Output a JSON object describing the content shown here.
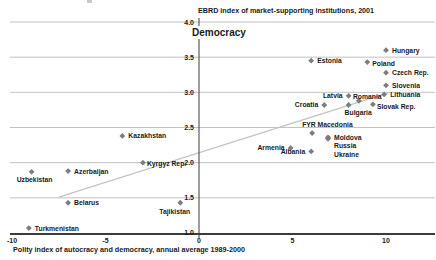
{
  "chart_data": {
    "type": "scatter",
    "title": "EBRD index of market-supporting institutions, 2001",
    "axis_heading": "Democracy",
    "xlabel": "Polity index of autocracy and democracy, annual average 1989-2000",
    "xlim": [
      -10.7,
      12.7
    ],
    "ylim": [
      1.0,
      4.0
    ],
    "x_ticks": [
      -10,
      -5,
      0,
      5,
      10
    ],
    "y_ticks": [
      4.0,
      3.5,
      3.0,
      2.5,
      2.0,
      1.5,
      1.0
    ],
    "grid": "horizontal-only",
    "legend": "none",
    "trend_line": {
      "x1": -7.5,
      "y1": 1.51,
      "x2": 10.2,
      "y2": 3.0
    },
    "colors": {
      "marker": "#7d7d7d",
      "gridline": "#b3b3b3",
      "axis": "#3c3c3c",
      "trend": "#c4c4c4",
      "text": "#1a1a1a",
      "background": "#ffffff"
    },
    "points": [
      {
        "name": "Hungary",
        "x": 10.0,
        "y": 3.6,
        "lx": 6,
        "ly": 2.5,
        "anchor": "start"
      },
      {
        "name": "Estonia",
        "x": 6.0,
        "y": 3.45,
        "lx": 6,
        "ly": 2.5,
        "anchor": "start"
      },
      {
        "name": "Poland",
        "x": 9.0,
        "y": 3.43,
        "lx": 5,
        "ly": 4,
        "anchor": "start"
      },
      {
        "name": "Czech Rep.",
        "x": 10.0,
        "y": 3.28,
        "lx": 6,
        "ly": 2.5,
        "anchor": "start"
      },
      {
        "name": "Slovenia",
        "x": 10.0,
        "y": 3.1,
        "lx": 6,
        "ly": 2.5,
        "anchor": "start"
      },
      {
        "name": "Lithuania",
        "x": 9.9,
        "y": 2.97,
        "lx": 6,
        "ly": 2.5,
        "anchor": "start"
      },
      {
        "name": "Latvia",
        "x": 8.0,
        "y": 2.95,
        "lx": -6,
        "ly": 2.5,
        "anchor": "end"
      },
      {
        "name": "Romania",
        "x": 8.55,
        "y": 2.88,
        "lx": -6,
        "ly": -2,
        "anchor": "start"
      },
      {
        "name": "Slovak Rep.",
        "x": 9.3,
        "y": 2.83,
        "lx": 4,
        "ly": 5,
        "anchor": "start"
      },
      {
        "name": "Bulgaria",
        "x": 8.0,
        "y": 2.82,
        "lx": -4,
        "ly": 10,
        "anchor": "start"
      },
      {
        "name": "Croatia",
        "x": 6.7,
        "y": 2.82,
        "lx": -6,
        "ly": 2.5,
        "anchor": "end"
      },
      {
        "name": "FYR Macedonia",
        "x": 6.05,
        "y": 2.42,
        "lx": -10,
        "ly": -6,
        "anchor": "start"
      },
      {
        "name": "Moldova",
        "x": 6.9,
        "y": 2.36,
        "lx": 6,
        "ly": 2.5,
        "anchor": "start"
      },
      {
        "name": "Russia",
        "x": 6.9,
        "y": 2.35,
        "lx": 6,
        "ly": 10,
        "anchor": "start"
      },
      {
        "name": "Ukraine",
        "x": 6.9,
        "y": 2.34,
        "lx": 6,
        "ly": 18,
        "anchor": "start"
      },
      {
        "name": "Armenia",
        "x": 4.9,
        "y": 2.21,
        "lx": -6,
        "ly": 2.5,
        "anchor": "end"
      },
      {
        "name": "Albania",
        "x": 6.0,
        "y": 2.16,
        "lx": -6,
        "ly": 2.5,
        "anchor": "end"
      },
      {
        "name": "Kazakhstan",
        "x": -4.1,
        "y": 2.38,
        "lx": 6,
        "ly": 2.5,
        "anchor": "start"
      },
      {
        "name": "Kyrgyz Rep.",
        "x": -3.0,
        "y": 2.0,
        "lx": 4,
        "ly": 3,
        "anchor": "start"
      },
      {
        "name": "Azerbaijan",
        "x": -7.0,
        "y": 1.88,
        "lx": 6,
        "ly": 2.5,
        "anchor": "start"
      },
      {
        "name": "Uzbekistan",
        "x": -8.95,
        "y": 1.87,
        "lx": -15,
        "ly": 10.5,
        "anchor": "start"
      },
      {
        "name": "Belarus",
        "x": -7.0,
        "y": 1.43,
        "lx": 6,
        "ly": 2.5,
        "anchor": "start"
      },
      {
        "name": "Tajikistan",
        "x": -1.0,
        "y": 1.43,
        "lx": -21,
        "ly": 11,
        "anchor": "start"
      },
      {
        "name": "Turkmenistan",
        "x": -9.1,
        "y": 1.07,
        "lx": 6,
        "ly": 2.5,
        "anchor": "start"
      }
    ]
  }
}
